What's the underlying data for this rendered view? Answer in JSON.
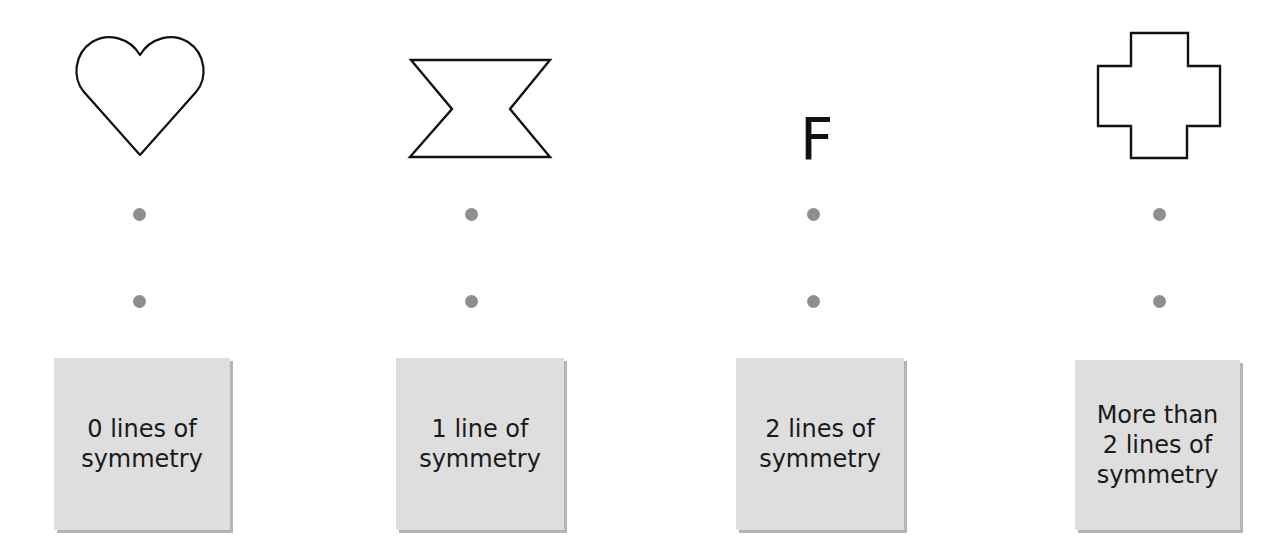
{
  "columns": [
    {
      "shape": "heart-icon",
      "label_lines": [
        "0 lines of",
        "symmetry"
      ]
    },
    {
      "shape": "hourglass-icon",
      "label_lines": [
        "1 line of",
        "symmetry"
      ]
    },
    {
      "shape": "letter-f",
      "glyph": "F",
      "label_lines": [
        "2 lines of",
        "symmetry"
      ]
    },
    {
      "shape": "cross-icon",
      "label_lines": [
        "More than",
        "2 lines of",
        "symmetry"
      ]
    }
  ],
  "colors": {
    "box_fill": "#dedede",
    "dot": "#8e8e8e",
    "stroke": "#111111"
  }
}
